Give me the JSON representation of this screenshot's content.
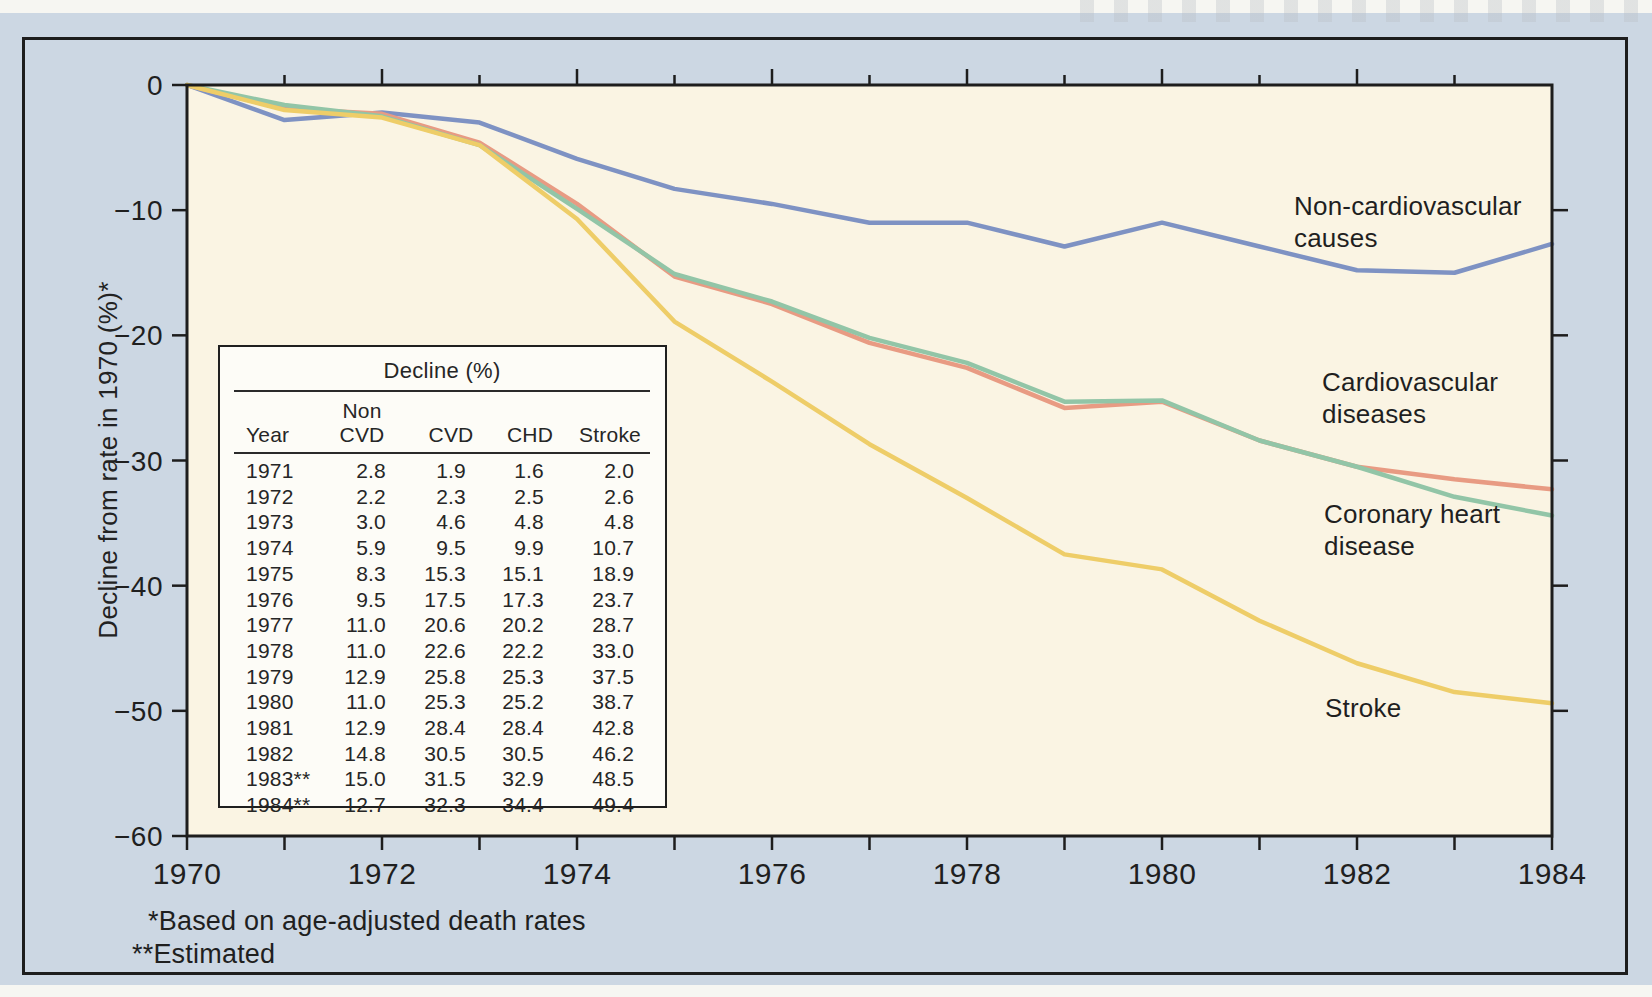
{
  "colors": {
    "panel_background": "#ccd7e3",
    "plot_background": "#faf4e3",
    "axis": "#1d1d1d",
    "series_non_cvd": "#7e92c3",
    "series_cvd": "#e89b83",
    "series_chd": "#92c5a7",
    "series_stroke": "#eecd68"
  },
  "figure": {
    "y_axis_title": "Decline from rate in 1970 (%)*",
    "footnote_rates": "*Based on age-adjusted death rates",
    "footnote_estimated": "**Estimated",
    "line_labels": {
      "non_cvd": "Non-cardiovascular\ncauses",
      "cvd": "Cardiovascular\ndiseases",
      "chd": "Coronary heart\ndisease",
      "stroke": "Stroke"
    }
  },
  "chart_data": {
    "type": "line",
    "title": "",
    "xlabel": "",
    "ylabel": "Decline from rate in 1970 (%)*",
    "x": [
      1970,
      1971,
      1972,
      1973,
      1974,
      1975,
      1976,
      1977,
      1978,
      1979,
      1980,
      1981,
      1982,
      1983,
      1984
    ],
    "xlim": [
      1970,
      1984
    ],
    "ylim": [
      -60,
      0
    ],
    "grid": false,
    "legend_position": "labels-at-line-ends-right",
    "x_tick_labels": [
      "1970",
      "1972",
      "1974",
      "1976",
      "1978",
      "1980",
      "1982",
      "1984"
    ],
    "x_tick_label_years": [
      1970,
      1972,
      1974,
      1976,
      1978,
      1980,
      1982,
      1984
    ],
    "y_tick_labels": [
      "0",
      "−10",
      "−20",
      "−30",
      "−40",
      "−50",
      "−60"
    ],
    "y_tick_values": [
      0,
      10,
      20,
      30,
      40,
      50,
      60
    ],
    "values_are_percent_decline_plotted_negative": true,
    "series": [
      {
        "key": "non_cvd",
        "name": "Non-cardiovascular causes",
        "color": "#7e92c3",
        "values": [
          0,
          2.8,
          2.2,
          3.0,
          5.9,
          8.3,
          9.5,
          11.0,
          11.0,
          12.9,
          11.0,
          12.9,
          14.8,
          15.0,
          12.7
        ]
      },
      {
        "key": "cvd",
        "name": "Cardiovascular diseases",
        "color": "#e89b83",
        "values": [
          0,
          1.9,
          2.3,
          4.6,
          9.5,
          15.3,
          17.5,
          20.6,
          22.6,
          25.8,
          25.3,
          28.4,
          30.5,
          31.5,
          32.3
        ]
      },
      {
        "key": "chd",
        "name": "Coronary heart disease",
        "color": "#92c5a7",
        "values": [
          0,
          1.6,
          2.5,
          4.8,
          9.9,
          15.1,
          17.3,
          20.2,
          22.2,
          25.3,
          25.2,
          28.4,
          30.5,
          32.9,
          34.4
        ]
      },
      {
        "key": "stroke",
        "name": "Stroke",
        "color": "#eecd68",
        "values": [
          0,
          2.0,
          2.6,
          4.8,
          10.7,
          18.9,
          23.7,
          28.7,
          33.0,
          37.5,
          38.7,
          42.8,
          46.2,
          48.5,
          49.4
        ]
      }
    ]
  },
  "table": {
    "title": "Decline (%)",
    "columns": [
      "Year",
      "Non\nCVD",
      "CVD",
      "CHD",
      "Stroke"
    ],
    "rows": [
      {
        "year": "1971",
        "non_cvd": "2.8",
        "cvd": "1.9",
        "chd": "1.6",
        "stroke": "2.0"
      },
      {
        "year": "1972",
        "non_cvd": "2.2",
        "cvd": "2.3",
        "chd": "2.5",
        "stroke": "2.6"
      },
      {
        "year": "1973",
        "non_cvd": "3.0",
        "cvd": "4.6",
        "chd": "4.8",
        "stroke": "4.8"
      },
      {
        "year": "1974",
        "non_cvd": "5.9",
        "cvd": "9.5",
        "chd": "9.9",
        "stroke": "10.7"
      },
      {
        "year": "1975",
        "non_cvd": "8.3",
        "cvd": "15.3",
        "chd": "15.1",
        "stroke": "18.9"
      },
      {
        "year": "1976",
        "non_cvd": "9.5",
        "cvd": "17.5",
        "chd": "17.3",
        "stroke": "23.7"
      },
      {
        "year": "1977",
        "non_cvd": "11.0",
        "cvd": "20.6",
        "chd": "20.2",
        "stroke": "28.7"
      },
      {
        "year": "1978",
        "non_cvd": "11.0",
        "cvd": "22.6",
        "chd": "22.2",
        "stroke": "33.0"
      },
      {
        "year": "1979",
        "non_cvd": "12.9",
        "cvd": "25.8",
        "chd": "25.3",
        "stroke": "37.5"
      },
      {
        "year": "1980",
        "non_cvd": "11.0",
        "cvd": "25.3",
        "chd": "25.2",
        "stroke": "38.7"
      },
      {
        "year": "1981",
        "non_cvd": "12.9",
        "cvd": "28.4",
        "chd": "28.4",
        "stroke": "42.8"
      },
      {
        "year": "1982",
        "non_cvd": "14.8",
        "cvd": "30.5",
        "chd": "30.5",
        "stroke": "46.2"
      },
      {
        "year": "1983**",
        "non_cvd": "15.0",
        "cvd": "31.5",
        "chd": "32.9",
        "stroke": "48.5"
      },
      {
        "year": "1984**",
        "non_cvd": "12.7",
        "cvd": "32.3",
        "chd": "34.4",
        "stroke": "49.4"
      }
    ]
  }
}
